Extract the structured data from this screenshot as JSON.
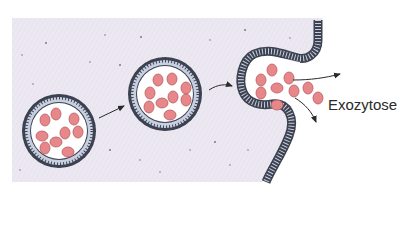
{
  "diagram": {
    "label": "Exozytose",
    "colors": {
      "cytoplasm": "#ece8f2",
      "membrane_fill": "#c8cfe0",
      "membrane_stroke": "#3c4250",
      "vesicle_interior": "#ffffff",
      "granule": "#e8878a",
      "granule_stroke": "#b85a60",
      "arrow": "#2a2a2a"
    },
    "stages": [
      {
        "name": "vesicle-1",
        "granules": 9
      },
      {
        "name": "vesicle-2",
        "granules": 8
      },
      {
        "name": "fusing-vesicle",
        "granules": 8
      }
    ]
  }
}
